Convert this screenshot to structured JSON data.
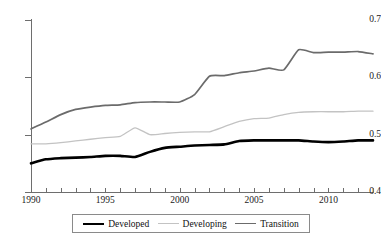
{
  "chart_data": {
    "type": "line",
    "title": "",
    "subtitle": "",
    "xlabel": "",
    "ylabel": "",
    "xlim": [
      1990,
      2013
    ],
    "ylim": [
      0.4,
      0.7
    ],
    "grid": false,
    "legend_position": "bottom",
    "x": [
      1990,
      1991,
      1992,
      1993,
      1994,
      1995,
      1996,
      1997,
      1998,
      1999,
      2000,
      2001,
      2002,
      2003,
      2004,
      2005,
      2006,
      2007,
      2008,
      2009,
      2010,
      2011,
      2012,
      2013
    ],
    "y_ticks": [
      0.4,
      0.5,
      0.6,
      0.7
    ],
    "y_tick_labels": [
      "0.4",
      "0.5",
      "0.6",
      "0.7"
    ],
    "x_ticks": [
      1990,
      1991,
      1992,
      1993,
      1994,
      1995,
      1996,
      1997,
      1998,
      1999,
      2000,
      2001,
      2002,
      2003,
      2004,
      2005,
      2006,
      2007,
      2008,
      2009,
      2010,
      2011,
      2012,
      2013
    ],
    "x_major_ticks": [
      1990,
      1995,
      2000,
      2005,
      2010
    ],
    "x_tick_labels": [
      "1990",
      "1995",
      "2000",
      "2005",
      "2010"
    ],
    "series": [
      {
        "name": "Developed",
        "color": "#000000",
        "width": 2.6,
        "values": [
          0.45,
          0.457,
          0.459,
          0.46,
          0.461,
          0.463,
          0.463,
          0.461,
          0.47,
          0.477,
          0.479,
          0.481,
          0.482,
          0.483,
          0.489,
          0.49,
          0.49,
          0.49,
          0.49,
          0.488,
          0.487,
          0.488,
          0.49,
          0.49
        ]
      },
      {
        "name": "Developing",
        "color": "#c3c3c3",
        "width": 1.3,
        "values": [
          0.484,
          0.484,
          0.486,
          0.489,
          0.492,
          0.495,
          0.497,
          0.512,
          0.5,
          0.502,
          0.504,
          0.505,
          0.505,
          0.514,
          0.523,
          0.528,
          0.529,
          0.535,
          0.539,
          0.54,
          0.54,
          0.54,
          0.541,
          0.541
        ]
      },
      {
        "name": "Transition",
        "color": "#6b6b6b",
        "width": 1.7,
        "values": [
          0.51,
          0.522,
          0.535,
          0.544,
          0.548,
          0.551,
          0.552,
          0.556,
          0.557,
          0.557,
          0.557,
          0.57,
          0.602,
          0.603,
          0.608,
          0.611,
          0.616,
          0.613,
          0.648,
          0.643,
          0.644,
          0.644,
          0.645,
          0.641
        ]
      }
    ]
  },
  "legend": {
    "entries": [
      {
        "label": "Developed",
        "swatch": "line-swatch-black"
      },
      {
        "label": "Developing",
        "swatch": "line-swatch-lightgray"
      },
      {
        "label": "Transition",
        "swatch": "line-swatch-gray"
      }
    ]
  },
  "colors": {
    "developed": "#000000",
    "developing": "#c3c3c3",
    "transition": "#6b6b6b",
    "axis": "#6e6e6e",
    "background": "#ffffff"
  }
}
